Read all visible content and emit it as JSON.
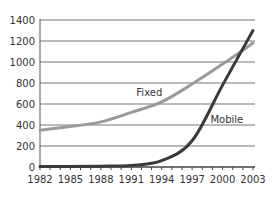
{
  "chart_data": {
    "type": "line",
    "title": "",
    "xlabel": "",
    "ylabel": "",
    "x": [
      1982,
      1985,
      1988,
      1991,
      1994,
      1997,
      2000,
      2003
    ],
    "x_ticks": [
      "1982",
      "1985",
      "1988",
      "1991",
      "1994",
      "1997",
      "2000",
      "2003"
    ],
    "y_ticks": [
      "0",
      "200",
      "400",
      "600",
      "800",
      "1000",
      "1200",
      "1400"
    ],
    "xlim": [
      1982,
      2003
    ],
    "ylim": [
      0,
      1400
    ],
    "grid": "horizontal",
    "legend": "inline labels",
    "series": [
      {
        "name": "Fixed",
        "color": "#9a9a9a",
        "values": [
          350,
          385,
          430,
          520,
          620,
          790,
          980,
          1180
        ]
      },
      {
        "name": "Mobile",
        "color": "#3a3a3a",
        "values": [
          5,
          5,
          8,
          15,
          60,
          250,
          780,
          1300
        ]
      }
    ],
    "annotations": [
      {
        "text": "Fixed",
        "x": 1991.5,
        "y": 680
      },
      {
        "text": "Mobile",
        "x": 1998.8,
        "y": 420
      }
    ]
  }
}
